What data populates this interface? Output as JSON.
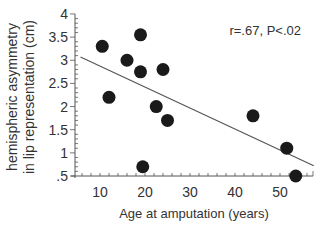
{
  "chart_data": {
    "type": "scatter",
    "title": "",
    "xlabel": "Age at amputation (years)",
    "ylabel_lines": [
      "hemispheric asymmetry",
      "in lip representation (cm)"
    ],
    "ylabel": "hemispheric asymmetry in lip representation (cm)",
    "annotation": "r=.67, P<.02",
    "xlim": [
      5,
      58
    ],
    "ylim": [
      0.5,
      4
    ],
    "x_ticks": [
      10,
      20,
      30,
      40,
      50
    ],
    "x_tick_labels": [
      "10",
      "20",
      "30",
      "40",
      "50"
    ],
    "y_ticks": [
      0.5,
      1,
      1.5,
      2,
      2.5,
      3,
      3.5,
      4
    ],
    "y_tick_labels": [
      ".5",
      "1",
      "1.5",
      "2",
      "2.5",
      "3",
      "3.5",
      "4"
    ],
    "grid": false,
    "points": [
      {
        "x": 10.5,
        "y": 3.3
      },
      {
        "x": 12,
        "y": 2.2
      },
      {
        "x": 16,
        "y": 3.0
      },
      {
        "x": 19,
        "y": 3.55
      },
      {
        "x": 19,
        "y": 2.75
      },
      {
        "x": 19.5,
        "y": 0.7
      },
      {
        "x": 22.5,
        "y": 2.0
      },
      {
        "x": 24,
        "y": 2.8
      },
      {
        "x": 25,
        "y": 1.7
      },
      {
        "x": 44,
        "y": 1.8
      },
      {
        "x": 51.5,
        "y": 1.1
      },
      {
        "x": 53.5,
        "y": 0.5
      }
    ],
    "regression_line": {
      "x1": 5,
      "y1": 3.07,
      "x2": 57.5,
      "y2": 0.72
    }
  }
}
